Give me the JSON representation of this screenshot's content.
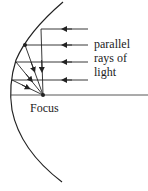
{
  "diagram": {
    "labels": {
      "rays_line1": "parallel",
      "rays_line2": "rays of",
      "rays_line3": "light",
      "focus": "Focus"
    },
    "colors": {
      "line": "#222222",
      "background": "#ffffff"
    },
    "focus_point": {
      "x": 43,
      "y": 95
    },
    "rays": [
      {
        "y": 29,
        "mirror_x": 41
      },
      {
        "y": 45,
        "mirror_x": 25
      },
      {
        "y": 62,
        "mirror_x": 16
      },
      {
        "y": 80,
        "mirror_x": 12
      }
    ]
  }
}
